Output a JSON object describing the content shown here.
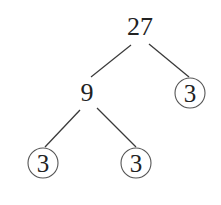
{
  "diagram": {
    "type": "factor-tree",
    "root": {
      "label": "27"
    },
    "level1": [
      {
        "label": "9",
        "circled": false
      },
      {
        "label": "3",
        "circled": true
      }
    ],
    "level2": [
      {
        "label": "3",
        "circled": true
      },
      {
        "label": "3",
        "circled": true
      }
    ]
  },
  "colors": {
    "text": "#222222",
    "lines": "#3a3a3a",
    "circles": "#555555",
    "background": "#ffffff"
  }
}
